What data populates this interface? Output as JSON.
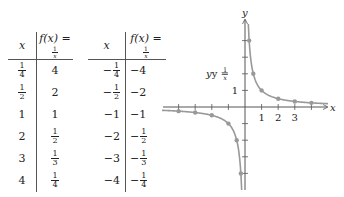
{
  "tables": [
    {
      "headers": {
        "x": "x",
        "fx_prefix": "f(x) = ",
        "fx_num": "1",
        "fx_den": "x"
      },
      "rows": [
        {
          "x": {
            "type": "frac",
            "sign": "",
            "num": "1",
            "den": "4"
          },
          "fx": {
            "type": "int",
            "text": "4"
          }
        },
        {
          "x": {
            "type": "frac",
            "sign": "",
            "num": "1",
            "den": "2"
          },
          "fx": {
            "type": "int",
            "text": "2"
          }
        },
        {
          "x": {
            "type": "int",
            "text": "1"
          },
          "fx": {
            "type": "int",
            "text": "1"
          }
        },
        {
          "x": {
            "type": "int",
            "text": "2"
          },
          "fx": {
            "type": "frac",
            "sign": "",
            "num": "1",
            "den": "2"
          }
        },
        {
          "x": {
            "type": "int",
            "text": "3"
          },
          "fx": {
            "type": "frac",
            "sign": "",
            "num": "1",
            "den": "3"
          }
        },
        {
          "x": {
            "type": "int",
            "text": "4"
          },
          "fx": {
            "type": "frac",
            "sign": "",
            "num": "1",
            "den": "4"
          }
        }
      ]
    },
    {
      "headers": {
        "x": "x",
        "fx_prefix": "f(x) = ",
        "fx_num": "1",
        "fx_den": "x"
      },
      "rows": [
        {
          "x": {
            "type": "frac",
            "sign": "−",
            "num": "1",
            "den": "4"
          },
          "fx": {
            "type": "int",
            "text": "−4"
          }
        },
        {
          "x": {
            "type": "frac",
            "sign": "−",
            "num": "1",
            "den": "2"
          },
          "fx": {
            "type": "int",
            "text": "−2"
          }
        },
        {
          "x": {
            "type": "int",
            "text": "−1"
          },
          "fx": {
            "type": "int",
            "text": "−1"
          }
        },
        {
          "x": {
            "type": "int",
            "text": "−2"
          },
          "fx": {
            "type": "frac",
            "sign": "−",
            "num": "1",
            "den": "2"
          }
        },
        {
          "x": {
            "type": "int",
            "text": "−3"
          },
          "fx": {
            "type": "frac",
            "sign": "−",
            "num": "1",
            "den": "3"
          }
        },
        {
          "x": {
            "type": "int",
            "text": "−4"
          },
          "fx": {
            "type": "frac",
            "sign": "−",
            "num": "1",
            "den": "4"
          }
        }
      ]
    }
  ],
  "graph": {
    "x_axis_label": "x",
    "y_axis_label": "y",
    "curve_label_prefix": "y = ",
    "curve_label_num": "1",
    "curve_label_den": "x",
    "x_tick_labels": [
      "1",
      "2",
      "3"
    ],
    "y_tick_labels": [
      "1"
    ]
  },
  "chart_data": {
    "type": "line",
    "title": "",
    "xlabel": "x",
    "ylabel": "y",
    "function": "y = 1/x",
    "xlim": [
      -4.5,
      4.5
    ],
    "ylim": [
      -4.5,
      4.5
    ],
    "grid": false,
    "series": [
      {
        "name": "y = 1/x (x > 0)",
        "x": [
          0.25,
          0.5,
          1,
          2,
          3,
          4
        ],
        "y": [
          4,
          2,
          1,
          0.5,
          0.3333,
          0.25
        ]
      },
      {
        "name": "y = 1/x (x < 0)",
        "x": [
          -0.25,
          -0.5,
          -1,
          -2,
          -3,
          -4
        ],
        "y": [
          -4,
          -2,
          -1,
          -0.5,
          -0.3333,
          -0.25
        ]
      }
    ],
    "annotations": [
      "y = 1/x"
    ],
    "x_ticks": [
      -4,
      -3,
      -2,
      -1,
      1,
      2,
      3,
      4
    ],
    "x_tick_labels": [
      "1",
      "2",
      "3"
    ],
    "y_ticks": [
      -4,
      -3,
      -2,
      -1,
      1,
      2,
      3,
      4
    ],
    "y_tick_labels": [
      "1"
    ],
    "colors": {
      "curve": "#999999",
      "points": "#999999",
      "axes": "#555555"
    }
  }
}
